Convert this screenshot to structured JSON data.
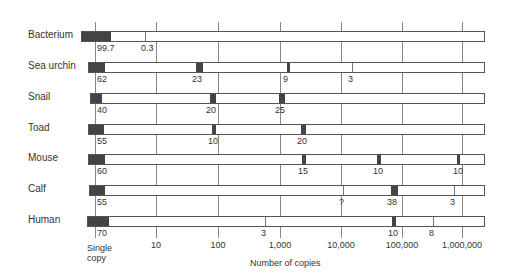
{
  "chart_data": {
    "type": "bar",
    "title": "",
    "xlabel": "Number of copies",
    "ylabel": "",
    "x_scale": "log",
    "x_ticks": [
      "Single copy",
      "10",
      "100",
      "1,000",
      "10,000",
      "100,000",
      "1,000,000"
    ],
    "categories": [
      "Bacterium",
      "Sea urchin",
      "Snail",
      "Toad",
      "Mouse",
      "Calf",
      "Human"
    ],
    "series": [
      {
        "name": "Bacterium",
        "segments": [
          {
            "copies": "single",
            "percent": "99.7"
          },
          {
            "copies": 10,
            "percent": "0.3"
          }
        ]
      },
      {
        "name": "Sea urchin",
        "segments": [
          {
            "copies": "single",
            "percent": "62"
          },
          {
            "copies": 50,
            "percent": "23"
          },
          {
            "copies": 1000,
            "percent": "9"
          },
          {
            "copies": 12000,
            "percent": "3"
          }
        ]
      },
      {
        "name": "Snail",
        "segments": [
          {
            "copies": "single",
            "percent": "40"
          },
          {
            "copies": 50,
            "percent": "20"
          },
          {
            "copies": 1000,
            "percent": "25"
          }
        ]
      },
      {
        "name": "Toad",
        "segments": [
          {
            "copies": "single",
            "percent": "55"
          },
          {
            "copies": 50,
            "percent": "10"
          },
          {
            "copies": 2000,
            "percent": "20"
          }
        ]
      },
      {
        "name": "Mouse",
        "segments": [
          {
            "copies": "single",
            "percent": "60"
          },
          {
            "copies": 2000,
            "percent": "15"
          },
          {
            "copies": 40000,
            "percent": "10"
          },
          {
            "copies": 1000000,
            "percent": "10"
          }
        ]
      },
      {
        "name": "Calf",
        "segments": [
          {
            "copies": "single",
            "percent": "55"
          },
          {
            "copies": 10000,
            "percent": "?"
          },
          {
            "copies": 60000,
            "percent": "38"
          },
          {
            "copies": 800000,
            "percent": "3"
          }
        ]
      },
      {
        "name": "Human",
        "segments": [
          {
            "copies": "single",
            "percent": "70"
          },
          {
            "copies": 500,
            "percent": "3"
          },
          {
            "copies": 60000,
            "percent": "10"
          },
          {
            "copies": 300000,
            "percent": "8"
          }
        ]
      }
    ],
    "grid": true,
    "legend": null
  },
  "axis": {
    "title": "Number of copies",
    "ticks": [
      {
        "label": "Single",
        "label2": "copy",
        "x": 95
      },
      {
        "label": "10",
        "x": 156
      },
      {
        "label": "100",
        "x": 218
      },
      {
        "label": "1,000",
        "x": 280
      },
      {
        "label": "10,000",
        "x": 341
      },
      {
        "label": "100,000",
        "x": 402
      },
      {
        "label": "1,000,000",
        "x": 462
      }
    ]
  },
  "rows": [
    {
      "label": "Bacterium",
      "y": 33,
      "left": 81,
      "first": {
        "w": 29
      },
      "marks": [
        {
          "x": 144,
          "thin": true,
          "label": "0.3"
        }
      ],
      "labels": [
        {
          "text": "99.7",
          "x": 97
        }
      ]
    },
    {
      "label": "Sea urchin",
      "y": 64,
      "left": 88,
      "first": {
        "w": 16
      },
      "marks": [
        {
          "x": 195,
          "w": 7,
          "label": "23"
        },
        {
          "x": 286,
          "w": 3,
          "label": "9"
        },
        {
          "x": 351,
          "thin": true,
          "label": "3"
        }
      ],
      "labels": [
        {
          "text": "62",
          "x": 97
        }
      ]
    },
    {
      "label": "Snail",
      "y": 95,
      "left": 90,
      "first": {
        "w": 11
      },
      "marks": [
        {
          "x": 209,
          "w": 6,
          "label": "20"
        },
        {
          "x": 278,
          "w": 6,
          "label": "25"
        }
      ],
      "labels": [
        {
          "text": "40",
          "x": 97
        }
      ]
    },
    {
      "label": "Toad",
      "y": 126,
      "left": 88,
      "first": {
        "w": 15
      },
      "marks": [
        {
          "x": 211,
          "w": 4,
          "label": "10"
        },
        {
          "x": 300,
          "w": 5,
          "label": "20"
        }
      ],
      "labels": [
        {
          "text": "55",
          "x": 97
        }
      ]
    },
    {
      "label": "Mouse",
      "y": 156,
      "left": 88,
      "first": {
        "w": 16
      },
      "marks": [
        {
          "x": 301,
          "w": 4,
          "label": "15"
        },
        {
          "x": 376,
          "w": 4,
          "label": "10"
        },
        {
          "x": 456,
          "w": 3,
          "label": "10"
        }
      ],
      "labels": [
        {
          "text": "60",
          "x": 97
        }
      ]
    },
    {
      "label": "Calf",
      "y": 187,
      "left": 89,
      "first": {
        "w": 15
      },
      "marks": [
        {
          "x": 342,
          "thin": true,
          "label": "?"
        },
        {
          "x": 390,
          "w": 7,
          "label": "38"
        },
        {
          "x": 453,
          "thin": true,
          "label": "3"
        }
      ],
      "labels": [
        {
          "text": "55",
          "x": 97
        }
      ]
    },
    {
      "label": "Human",
      "y": 218,
      "left": 87,
      "first": {
        "w": 21
      },
      "marks": [
        {
          "x": 264,
          "thin": true,
          "label": "3"
        },
        {
          "x": 391,
          "w": 4,
          "label": "10"
        },
        {
          "x": 432,
          "thin": true,
          "label": "8"
        }
      ],
      "labels": [
        {
          "text": "70",
          "x": 97
        }
      ]
    }
  ]
}
